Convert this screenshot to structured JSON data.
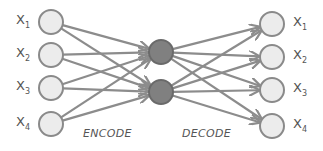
{
  "colors": {
    "edge": "#8c8c8c",
    "io_node_fill": "#ececec",
    "io_node_stroke": "#8a8a8a",
    "hidden_node_fill": "#808080",
    "hidden_node_stroke": "#6a6a6a",
    "text": "#555555"
  },
  "inputs": [
    {
      "label": "X",
      "sub": "1",
      "x": 51,
      "y": 22
    },
    {
      "label": "X",
      "sub": "2",
      "x": 51,
      "y": 55
    },
    {
      "label": "X",
      "sub": "3",
      "x": 51,
      "y": 88
    },
    {
      "label": "X",
      "sub": "4",
      "x": 51,
      "y": 124
    }
  ],
  "hidden": [
    {
      "x": 161,
      "y": 52
    },
    {
      "x": 161,
      "y": 92
    }
  ],
  "outputs": [
    {
      "label": "X",
      "sub": "1",
      "x": 272,
      "y": 24
    },
    {
      "label": "X",
      "sub": "2",
      "x": 272,
      "y": 57
    },
    {
      "label": "X",
      "sub": "3",
      "x": 272,
      "y": 90
    },
    {
      "label": "X",
      "sub": "4",
      "x": 272,
      "y": 126
    }
  ],
  "stages": {
    "encode": "ENCODE",
    "decode": "DECODE"
  },
  "node_radius": 12
}
